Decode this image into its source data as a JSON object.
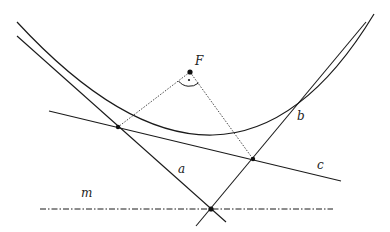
{
  "diagram": {
    "title": "",
    "labels": {
      "focus": "F",
      "tangent_a": "a",
      "tangent_b": "b",
      "tangent_c": "c",
      "directrix": "m"
    },
    "colors": {
      "stroke": "#1a1a1a",
      "background": "#ffffff"
    },
    "elements": [
      {
        "type": "parabola",
        "name": "parabola",
        "style": "solid"
      },
      {
        "type": "point",
        "name": "focus",
        "label": "F"
      },
      {
        "type": "line",
        "name": "tangent-a",
        "label": "a",
        "style": "solid"
      },
      {
        "type": "line",
        "name": "tangent-b",
        "label": "b",
        "style": "solid"
      },
      {
        "type": "line",
        "name": "tangent-c",
        "label": "c",
        "style": "solid"
      },
      {
        "type": "line",
        "name": "directrix",
        "label": "m",
        "style": "dash-dot"
      },
      {
        "type": "segment",
        "name": "focus-to-point-1",
        "style": "dotted"
      },
      {
        "type": "segment",
        "name": "focus-to-point-2",
        "style": "dotted"
      },
      {
        "type": "angle-mark",
        "name": "right-angle-at-focus"
      },
      {
        "type": "point",
        "name": "tangent-point-intersection-ac"
      },
      {
        "type": "point",
        "name": "tangent-point-intersection-bc"
      },
      {
        "type": "point",
        "name": "tangent-intersection-on-directrix"
      }
    ]
  }
}
